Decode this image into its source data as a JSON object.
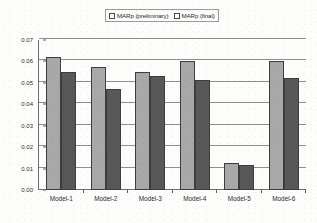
{
  "chart_data": {
    "type": "bar",
    "title": "",
    "subtitle": "",
    "xlabel": "",
    "ylabel": "",
    "categories": [
      "Model-1",
      "Model-2",
      "Model-3",
      "Model-4",
      "Model-5",
      "Model-6"
    ],
    "series": [
      {
        "name": "MARp (preliminary)",
        "color": "#a8a8a8",
        "values": [
          0.062,
          0.0575,
          0.0553,
          0.06,
          0.0128,
          0.0603
        ]
      },
      {
        "name": "MARp (final)",
        "color": "#585858",
        "values": [
          0.055,
          0.047,
          0.0532,
          0.0513,
          0.0116,
          0.0525
        ]
      }
    ],
    "ylim": [
      0.0,
      0.07
    ],
    "ytick_values": [
      0.07,
      0.06,
      0.05,
      0.04,
      0.03,
      0.02,
      0.01,
      0.0
    ],
    "ytick_labels": [
      "0.07",
      "0.06",
      "0.05",
      "0.04",
      "0.03",
      "0.02",
      "0.01",
      "0.00"
    ],
    "grid": true,
    "grid_axis": "y",
    "legend_position": "top-center"
  },
  "legend": {
    "entries": [
      {
        "label": "MARp (preliminary)"
      },
      {
        "label": "MARp (final)"
      }
    ]
  }
}
